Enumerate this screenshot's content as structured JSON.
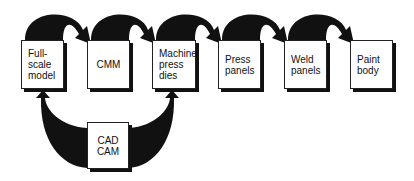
{
  "diagram": {
    "type": "process-flow",
    "nodes": [
      {
        "id": "full-scale-model",
        "label": "Full-\nscale\nmodel",
        "lines": [
          "Full-",
          "scale",
          "model"
        ],
        "x": 21,
        "y": 40,
        "w": 43,
        "h": 49
      },
      {
        "id": "cmm",
        "label": "CMM",
        "lines": [
          "CMM"
        ],
        "x": 87,
        "y": 40,
        "w": 43,
        "h": 49
      },
      {
        "id": "machine-press-dies",
        "label": "Machine press dies",
        "lines": [
          "Machine",
          "press",
          "dies"
        ],
        "x": 152,
        "y": 40,
        "w": 44,
        "h": 49
      },
      {
        "id": "press-panels",
        "label": "Press panels",
        "lines": [
          "Press",
          "panels"
        ],
        "x": 218,
        "y": 40,
        "w": 43,
        "h": 49
      },
      {
        "id": "weld-panels",
        "label": "Weld panels",
        "lines": [
          "Weld",
          "panels"
        ],
        "x": 284,
        "y": 40,
        "w": 43,
        "h": 49
      },
      {
        "id": "paint-body",
        "label": "Paint body",
        "lines": [
          "Paint",
          "body"
        ],
        "x": 350,
        "y": 40,
        "w": 43,
        "h": 49
      },
      {
        "id": "cad-cam",
        "label": "CAD CAM",
        "lines": [
          "CAD",
          "CAM"
        ],
        "x": 87,
        "y": 122,
        "w": 42,
        "h": 47
      }
    ],
    "edges": [
      {
        "from": "full-scale-model",
        "to": "cmm"
      },
      {
        "from": "cmm",
        "to": "machine-press-dies"
      },
      {
        "from": "machine-press-dies",
        "to": "press-panels"
      },
      {
        "from": "press-panels",
        "to": "weld-panels"
      },
      {
        "from": "weld-panels",
        "to": "paint-body"
      },
      {
        "from": "cad-cam",
        "to": "full-scale-model"
      },
      {
        "from": "cad-cam",
        "to": "machine-press-dies"
      }
    ],
    "colors": {
      "arrow": "#111111",
      "box_border": "#222222",
      "background": "#ffffff"
    }
  }
}
